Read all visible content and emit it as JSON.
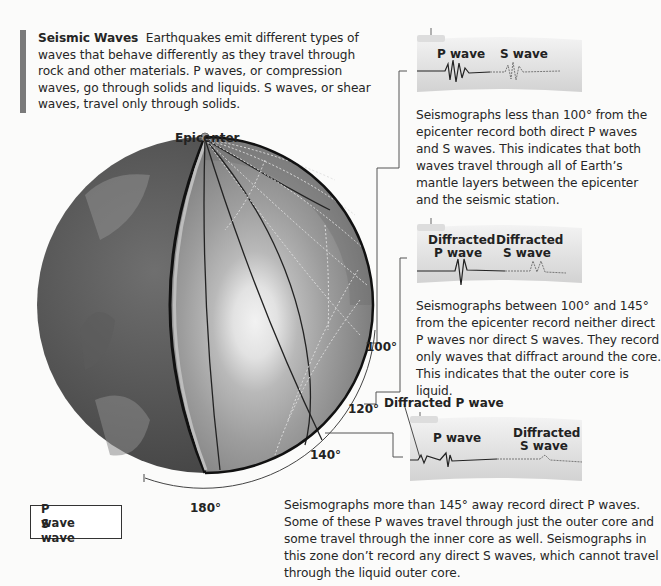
{
  "intro": {
    "title": "Seismic Waves",
    "text": "Earthquakes emit different types of waves that behave differently as they travel through rock and other materials. P waves, or compression waves, go through solids and liquids. S waves, or shear waves, travel only through solids."
  },
  "globe": {
    "epicenter_label": "Epicenter",
    "angle_labels": [
      "100°",
      "120°",
      "140°",
      "180°"
    ]
  },
  "seismographs": [
    {
      "labels": [
        "P wave",
        "S wave"
      ],
      "description": "Seismographs less than 100° from the epicenter record both direct P waves and S waves. This indicates that both waves travel through all of Earth’s mantle layers between the epicenter and the seismic station."
    },
    {
      "labels": [
        "Diffracted P wave",
        "Diffracted S wave"
      ],
      "description": "Seismographs between 100° and 145° from the epicenter record neither direct P waves nor direct S waves. They record only waves that diffract around the core. This indicates that the outer core is liquid."
    },
    {
      "callout": "Diffracted P wave",
      "labels": [
        "P wave",
        "Diffracted S wave"
      ],
      "description": "Seismographs more than 145° away record direct P waves. Some of these P waves travel through just the outer core and some travel through the inner core as well. Seismographs in this zone don’t record any direct S waves, which cannot travel through the liquid outer core."
    }
  ],
  "legend": {
    "items": [
      {
        "label": "P wave",
        "style": "solid"
      },
      {
        "label": "S wave",
        "style": "dotted"
      }
    ]
  }
}
